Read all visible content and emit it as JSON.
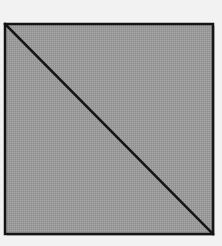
{
  "diagram": {
    "shape": "square",
    "divider": "diagonal",
    "diagonal_direction": "top-left-to-bottom-right",
    "regions": 2,
    "colors": {
      "background": "#f2f2f2",
      "fill": "#9a9a9a",
      "stroke": "#141414",
      "shadow": "#c8c8c8"
    },
    "square": {
      "x": 5,
      "y": 24,
      "width": 208,
      "height": 210
    }
  }
}
